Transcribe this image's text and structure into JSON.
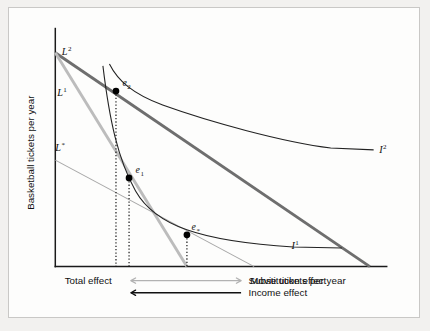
{
  "figure": {
    "kind": "indifference-curve-budget-line-diagram",
    "background_color": "#f2f1ef",
    "panel_color": "#fdfdfc",
    "border_color": "#c9c8c6"
  },
  "axes": {
    "y_title": "Basketball tickets per year",
    "x_title": "Movie tickets per year",
    "origin": {
      "x": 45,
      "y": 277
    },
    "y_top": {
      "x": 45,
      "y": 22
    },
    "x_right": {
      "x": 400,
      "y": 277
    },
    "axis_color": "#1a1a1a"
  },
  "budget_lines": [
    {
      "id": "L2",
      "label": "L",
      "superscript": "2",
      "label_x": 52,
      "label_y": 50,
      "color": "#6e6e6e",
      "width": 3.1,
      "from": {
        "x": 45,
        "y": 48
      },
      "to": {
        "x": 382,
        "y": 277
      }
    },
    {
      "id": "L1",
      "label": "L",
      "superscript": "1",
      "label_x": 47,
      "label_y": 94,
      "color": "#bcbcbc",
      "width": 3.1,
      "from": {
        "x": 45,
        "y": 48
      },
      "to": {
        "x": 186,
        "y": 277
      }
    },
    {
      "id": "Lstar",
      "label": "L",
      "superscript": "*",
      "label_x": 45,
      "label_y": 153,
      "color": "#a6a6a6",
      "width": 1.1,
      "from": {
        "x": 45,
        "y": 163
      },
      "to": {
        "x": 258,
        "y": 277
      }
    }
  ],
  "indifference_curves": [
    {
      "id": "I1",
      "label": "I",
      "superscript": "1",
      "label_x": 298,
      "label_y": 258,
      "color": "#222222",
      "path": "M 96,62 C 103,120 112,162 131,196 C 152,233 200,250 300,256 L 352,257"
    },
    {
      "id": "I2",
      "label": "I",
      "superscript": "2",
      "label_x": 392,
      "label_y": 155,
      "color": "#222222",
      "path": "M 103,60 C 112,78 128,92 160,104 C 210,122 290,144 340,150 L 386,152"
    }
  ],
  "equilibria": [
    {
      "id": "e2",
      "label": "e",
      "subscript": "2",
      "x": 110,
      "y": 89,
      "label_x": 117,
      "label_y": 84,
      "radius": 3.6,
      "drop_to_y": 277
    },
    {
      "id": "e1",
      "label": "e",
      "subscript": "1",
      "x": 124,
      "y": 182,
      "label_x": 131,
      "label_y": 177,
      "radius": 3.6,
      "drop_to_y": 277
    },
    {
      "id": "estar",
      "label": "e",
      "subscript": "*",
      "x": 186,
      "y": 243,
      "label_x": 191,
      "label_y": 238,
      "radius": 3.6,
      "drop_to_y": 277
    }
  ],
  "effects": [
    {
      "id": "substitution",
      "label": "Substitution effect",
      "label_x": 252,
      "label_y": 296,
      "color": "#b2b2b2",
      "y": 292,
      "from_x": 244,
      "to_x": 126,
      "double_headed": true
    },
    {
      "id": "income",
      "label": "Income effect",
      "label_x": 252,
      "label_y": 309,
      "color": "#111111",
      "y": 305,
      "from_x": 244,
      "to_x": 126,
      "double_headed": false
    }
  ],
  "total_effect": {
    "label": "Total effect",
    "label_x": 55,
    "label_y": 296
  }
}
